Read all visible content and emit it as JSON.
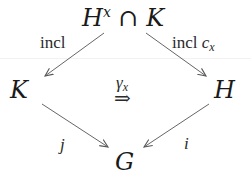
{
  "diagram": {
    "type": "commutative-diagram",
    "nodes": {
      "top": {
        "base": "H",
        "sup": "x",
        "op": "∩",
        "right": "K"
      },
      "left": {
        "label": "K"
      },
      "right": {
        "label": "H"
      },
      "bottom": {
        "label": "G"
      }
    },
    "edges": {
      "top_left": {
        "label": "incl"
      },
      "top_right": {
        "label": "incl",
        "sub_label_base": "c",
        "sub_label_sub": "x"
      },
      "left_bottom": {
        "label": "j"
      },
      "right_bottom": {
        "label": "i"
      }
    },
    "two_cell": {
      "label_base": "γ",
      "label_sub": "x",
      "arrow": "⇒"
    },
    "colors": {
      "arrow": "#555555",
      "text": "#1a1a1a"
    }
  }
}
